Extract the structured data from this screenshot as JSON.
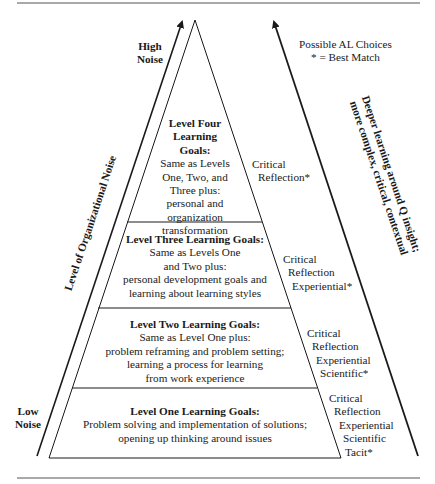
{
  "diagram": {
    "left_axis": {
      "top_label": [
        "High",
        "Noise"
      ],
      "bottom_label": [
        "Low",
        "Noise"
      ],
      "axis_label": "Level of Organizational Noise"
    },
    "right_axis": {
      "legend": [
        "Possible AL Choices",
        "* = Best Match"
      ],
      "axis_label": [
        "Deeper learning around Q insight;",
        "more complex, critical, contextual"
      ]
    },
    "levels": [
      {
        "title": [
          "Level Four",
          "Learning",
          "Goals:"
        ],
        "body": [
          "Same as Levels",
          "One, Two, and",
          "Three plus:",
          "personal and",
          "organization",
          "transformation"
        ],
        "choices": [
          "Critical",
          "Reflection*"
        ]
      },
      {
        "title": [
          "Level Three Learning Goals:"
        ],
        "body": [
          "Same as Levels One",
          "and Two plus:",
          "personal development goals and",
          "learning about learning styles"
        ],
        "choices": [
          "Critical",
          "Reflection",
          "Experiential*"
        ]
      },
      {
        "title": [
          "Level Two Learning Goals:"
        ],
        "body": [
          "Same as Level One plus:",
          "problem reframing and problem setting;",
          "learning a process for learning",
          "from work experience"
        ],
        "choices": [
          "Critical",
          "Reflection",
          "Experiential",
          "Scientific*"
        ]
      },
      {
        "title": [
          "Level One Learning Goals:"
        ],
        "body": [
          "Problem solving and implementation of solutions;",
          "opening up thinking around issues"
        ],
        "choices": [
          "Critical",
          "Reflection",
          "Experiential",
          "Scientific",
          "Tacit*"
        ]
      }
    ],
    "colors": {
      "line": "#1a1a1a",
      "rule": "#555555",
      "background": "#ffffff"
    }
  }
}
